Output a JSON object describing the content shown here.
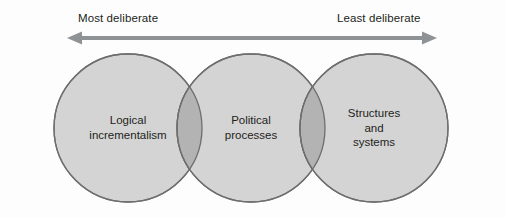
{
  "diagram": {
    "type": "venn-continuum",
    "axis": {
      "left_label": "Most deliberate",
      "right_label": "Least deliberate",
      "arrow": {
        "style": "double-headed",
        "color": "#8e9295",
        "x_start": 66,
        "x_end": 438,
        "y": 39
      }
    },
    "circles": [
      {
        "id": "logical-incrementalism",
        "lines": [
          "Logical",
          "incrementalism"
        ],
        "cx": 128,
        "cy": 128,
        "r": 74,
        "fill": "#d4d4d4",
        "stroke": "#6e6e6e"
      },
      {
        "id": "political-processes",
        "lines": [
          "Political",
          "processes"
        ],
        "cx": 251,
        "cy": 128,
        "r": 74,
        "fill": "#d4d4d4",
        "stroke": "#6e6e6e"
      },
      {
        "id": "structures-and-systems",
        "lines": [
          "Structures",
          "and",
          "systems"
        ],
        "cx": 374,
        "cy": 128,
        "r": 74,
        "fill": "#d4d4d4",
        "stroke": "#6e6e6e"
      }
    ],
    "overlap_fill": "#b3b3b3",
    "background": "#fdfdfd",
    "text_color": "#231f20"
  }
}
